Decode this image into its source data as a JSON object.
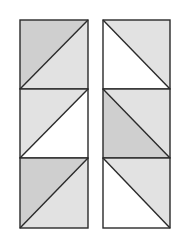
{
  "figure": {
    "colors": {
      "dark": "#cfcfcf",
      "light": "#e2e2e2",
      "white": "#ffffff",
      "stroke": "#2a2a2a"
    },
    "columns": [
      {
        "name": "left-column",
        "x": 20,
        "width": 68,
        "diagonal": "bottom-left-to-top-right",
        "tiles": [
          {
            "upper": "dark",
            "lower": "light"
          },
          {
            "upper": "light",
            "lower": "white"
          },
          {
            "upper": "dark",
            "lower": "light"
          }
        ]
      },
      {
        "name": "right-column",
        "x": 103,
        "width": 67,
        "diagonal": "top-left-to-bottom-right",
        "tiles": [
          {
            "upper": "light",
            "lower": "white"
          },
          {
            "upper": "light",
            "lower": "dark"
          },
          {
            "upper": "light",
            "lower": "white"
          }
        ]
      }
    ],
    "rows_y": [
      20,
      89,
      158,
      228
    ]
  }
}
